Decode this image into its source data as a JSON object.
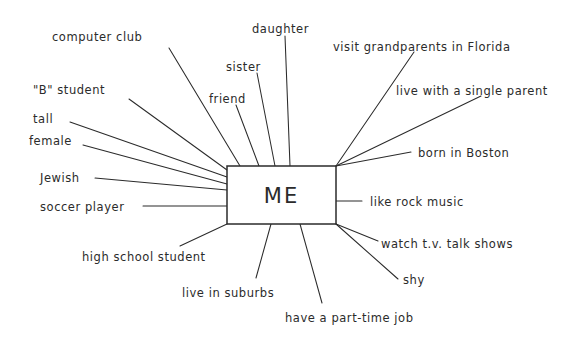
{
  "diagram": {
    "type": "web-diagram",
    "center": {
      "label": "ME",
      "box": {
        "x": 227,
        "y": 166,
        "width": 109,
        "height": 58
      }
    },
    "ink_color": "#2b2b2b",
    "background_color": "#ffffff",
    "nodes": [
      {
        "id": "computer-club",
        "label": "computer club",
        "text_x": 52,
        "text_y": 32,
        "line": {
          "x1": 169,
          "y1": 48,
          "x2": 240,
          "y2": 166
        }
      },
      {
        "id": "b-student",
        "label": "\"B\" student",
        "text_x": 33,
        "text_y": 85,
        "line": {
          "x1": 129,
          "y1": 99,
          "x2": 227,
          "y2": 170
        }
      },
      {
        "id": "tall",
        "label": "tall",
        "text_x": 33,
        "text_y": 114,
        "line": {
          "x1": 70,
          "y1": 122,
          "x2": 227,
          "y2": 177
        }
      },
      {
        "id": "female",
        "label": "female",
        "text_x": 29,
        "text_y": 136,
        "line": {
          "x1": 83,
          "y1": 145,
          "x2": 227,
          "y2": 184
        }
      },
      {
        "id": "jewish",
        "label": "Jewish",
        "text_x": 40,
        "text_y": 173,
        "line": {
          "x1": 95,
          "y1": 178,
          "x2": 227,
          "y2": 190
        }
      },
      {
        "id": "soccer-player",
        "label": "soccer player",
        "text_x": 40,
        "text_y": 202,
        "line": {
          "x1": 143,
          "y1": 206,
          "x2": 227,
          "y2": 206
        }
      },
      {
        "id": "high-school-student",
        "label": "high school student",
        "text_x": 82,
        "text_y": 252,
        "line": {
          "x1": 180,
          "y1": 246,
          "x2": 227,
          "y2": 224
        }
      },
      {
        "id": "live-in-suburbs",
        "label": "live in suburbs",
        "text_x": 182,
        "text_y": 288,
        "line": {
          "x1": 256,
          "y1": 278,
          "x2": 271,
          "y2": 224
        }
      },
      {
        "id": "have-part-time-job",
        "label": "have a part-time job",
        "text_x": 285,
        "text_y": 313,
        "line": {
          "x1": 322,
          "y1": 303,
          "x2": 300,
          "y2": 224
        }
      },
      {
        "id": "shy",
        "label": "shy",
        "text_x": 403,
        "text_y": 275,
        "line": {
          "x1": 398,
          "y1": 279,
          "x2": 336,
          "y2": 224
        }
      },
      {
        "id": "watch-tv-talk-shows",
        "label": "watch t.v. talk shows",
        "text_x": 381,
        "text_y": 239,
        "line": {
          "x1": 378,
          "y1": 241,
          "x2": 336,
          "y2": 224
        }
      },
      {
        "id": "like-rock-music",
        "label": "like rock music",
        "text_x": 370,
        "text_y": 197,
        "line": {
          "x1": 362,
          "y1": 201,
          "x2": 336,
          "y2": 201
        }
      },
      {
        "id": "born-in-boston",
        "label": "born in Boston",
        "text_x": 418,
        "text_y": 148,
        "line": {
          "x1": 411,
          "y1": 152,
          "x2": 336,
          "y2": 166
        }
      },
      {
        "id": "live-with-single-parent",
        "label": "live with a single parent",
        "text_x": 396,
        "text_y": 86,
        "line": {
          "x1": 481,
          "y1": 96,
          "x2": 336,
          "y2": 166
        }
      },
      {
        "id": "visit-grandparents-florida",
        "label": "visit grandparents in Florida",
        "text_x": 333,
        "text_y": 42,
        "line": {
          "x1": 414,
          "y1": 52,
          "x2": 336,
          "y2": 166
        }
      },
      {
        "id": "daughter",
        "label": "daughter",
        "text_x": 252,
        "text_y": 24,
        "line": {
          "x1": 285,
          "y1": 36,
          "x2": 290,
          "y2": 166
        }
      },
      {
        "id": "sister",
        "label": "sister",
        "text_x": 226,
        "text_y": 62,
        "line": {
          "x1": 257,
          "y1": 73,
          "x2": 275,
          "y2": 166
        }
      },
      {
        "id": "friend",
        "label": "friend",
        "text_x": 209,
        "text_y": 94,
        "line": {
          "x1": 236,
          "y1": 105,
          "x2": 259,
          "y2": 166
        }
      }
    ]
  }
}
